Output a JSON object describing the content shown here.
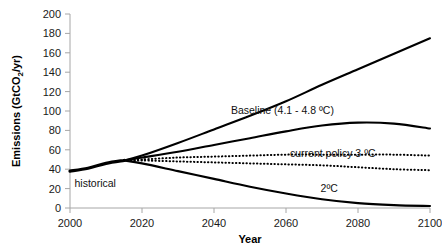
{
  "chart_data": {
    "type": "line",
    "title": "",
    "xlabel": "Year",
    "ylabel": "Emissions (GtCO2/yr)",
    "ylabel_rich": {
      "pre": "Emissions (GtCO",
      "sub": "2",
      "post": "/yr)"
    },
    "xlim": [
      2000,
      2100
    ],
    "ylim": [
      0,
      200
    ],
    "xticks": [
      2000,
      2020,
      2040,
      2060,
      2080,
      2100
    ],
    "yticks": [
      0,
      20,
      40,
      60,
      80,
      100,
      120,
      140,
      160,
      180,
      200
    ],
    "grid": false,
    "legend": "inline-annotations",
    "series": [
      {
        "name": "historical",
        "style": "solid-thick",
        "label": "historical",
        "label_x": 2007,
        "label_y": 22,
        "x": [
          2000,
          2005,
          2010,
          2015
        ],
        "values": [
          38,
          41,
          46,
          49
        ]
      },
      {
        "name": "baseline",
        "style": "solid",
        "label": "Baseline (4.1 - 4.8 ºC)",
        "label_x": 2059,
        "label_y": 97,
        "x": [
          2015,
          2020,
          2030,
          2040,
          2050,
          2060,
          2070,
          2080,
          2090,
          2100
        ],
        "values": [
          49,
          54,
          67,
          81,
          95,
          110,
          127,
          143,
          159,
          175
        ]
      },
      {
        "name": "current-policy-upper",
        "style": "solid",
        "label": "",
        "x": [
          2015,
          2020,
          2030,
          2040,
          2050,
          2060,
          2070,
          2080,
          2090,
          2100
        ],
        "values": [
          49,
          52,
          58,
          65,
          72,
          79,
          85,
          88,
          87,
          82
        ]
      },
      {
        "name": "current-policy-dotted-upper",
        "style": "dotted",
        "label": "current policy 3 ºC",
        "label_x": 2073,
        "label_y": 53,
        "x": [
          2015,
          2020,
          2030,
          2040,
          2050,
          2060,
          2070,
          2080,
          2090,
          2100
        ],
        "values": [
          49,
          50,
          52,
          53,
          54,
          55,
          55,
          55,
          55,
          54
        ]
      },
      {
        "name": "current-policy-dotted-lower",
        "style": "dotted",
        "label": "",
        "x": [
          2015,
          2020,
          2030,
          2040,
          2050,
          2060,
          2070,
          2080,
          2090,
          2100
        ],
        "values": [
          49,
          49,
          48,
          47,
          46,
          45,
          44,
          42,
          40,
          39
        ]
      },
      {
        "name": "two-degrees",
        "style": "solid",
        "label": "2ºC",
        "label_x": 2072,
        "label_y": 16,
        "x": [
          2015,
          2020,
          2030,
          2040,
          2050,
          2060,
          2070,
          2080,
          2090,
          2100
        ],
        "values": [
          49,
          46,
          38,
          30,
          22,
          15,
          9,
          5,
          3,
          2
        ]
      }
    ]
  },
  "axis": {
    "x_title": "Year",
    "y_title_pre": "Emissions (GtCO",
    "y_title_sub": "2",
    "y_title_post": "/yr)",
    "x_tick_labels": [
      "2000",
      "2020",
      "2040",
      "2060",
      "2080",
      "2100"
    ],
    "y_tick_labels": [
      "0",
      "20",
      "40",
      "60",
      "80",
      "100",
      "120",
      "140",
      "160",
      "180",
      "200"
    ]
  },
  "annotations": {
    "historical": "historical",
    "baseline": "Baseline (4.1 - 4.8 ºC)",
    "current_policy": "current policy 3 ºC",
    "two_degrees": "2ºC"
  },
  "colors": {
    "curve": "#000000",
    "axis": "#a6a6a6",
    "text": "#111111",
    "background": "#ffffff"
  }
}
